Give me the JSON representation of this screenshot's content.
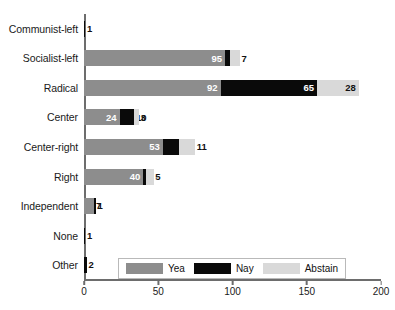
{
  "chart_data": {
    "type": "bar",
    "orientation": "horizontal",
    "stacked": true,
    "title": "",
    "xlabel": "",
    "ylabel": "",
    "xlim": [
      0,
      200
    ],
    "xticks": [
      0,
      50,
      100,
      150,
      200
    ],
    "grid": false,
    "legend_position": "bottom-center",
    "categories": [
      "Communist-left",
      "Socialist-left",
      "Radical",
      "Center",
      "Center-right",
      "Right",
      "Independent",
      "None",
      "Other"
    ],
    "series": [
      {
        "name": "Yea",
        "color": "#8d8d8d",
        "values": [
          0,
          95,
          92,
          24,
          53,
          40,
          7,
          0,
          0
        ]
      },
      {
        "name": "Nay",
        "color": "#0a0a0a",
        "values": [
          1,
          3,
          65,
          10,
          11,
          2,
          1,
          1,
          2
        ]
      },
      {
        "name": "Abstain",
        "color": "#d9d9d9",
        "values": [
          0,
          7,
          28,
          3,
          11,
          5,
          0,
          0,
          0
        ]
      }
    ]
  },
  "legend": {
    "items": [
      {
        "label": "Yea",
        "color": "#8d8d8d"
      },
      {
        "label": "Nay",
        "color": "#0a0a0a"
      },
      {
        "label": "Abstain",
        "color": "#d9d9d9"
      }
    ]
  }
}
